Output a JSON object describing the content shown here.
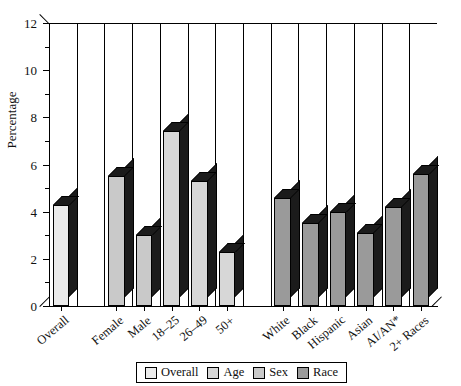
{
  "chart_data": {
    "type": "bar",
    "title": "",
    "xlabel": "",
    "ylabel": "Percentage",
    "ylim": [
      0,
      12
    ],
    "ytick_step": 2,
    "yminor_step": 1,
    "grid": true,
    "legend_position": "bottom",
    "style": "3d-bar",
    "categories": [
      "Overall",
      "Female",
      "Male",
      "18–25",
      "26–49",
      "50+",
      "White",
      "Black",
      "Hispanic",
      "Asian",
      "AI/AN*",
      "2+ Races"
    ],
    "values": [
      4.3,
      5.5,
      3.0,
      7.4,
      5.3,
      2.3,
      4.6,
      3.5,
      4.0,
      3.1,
      4.2,
      5.6
    ],
    "groups": [
      {
        "name": "Overall",
        "color": "#ebebeb",
        "categories": [
          "Overall"
        ],
        "values": [
          4.3
        ]
      },
      {
        "name": "Sex",
        "color": "#c9c9c9",
        "categories": [
          "Female",
          "Male"
        ],
        "values": [
          5.5,
          3.0
        ]
      },
      {
        "name": "Age",
        "color": "#d7d7d7",
        "categories": [
          "18–25",
          "26–49",
          "50+"
        ],
        "values": [
          7.4,
          5.3,
          2.3
        ]
      },
      {
        "name": "Race",
        "color": "#9a9a9a",
        "categories": [
          "White",
          "Black",
          "Hispanic",
          "Asian",
          "AI/AN*",
          "2+ Races"
        ],
        "values": [
          4.6,
          3.5,
          4.0,
          3.1,
          4.2,
          5.6
        ]
      }
    ],
    "ytick_labels": [
      "0",
      "2",
      "4",
      "6",
      "8",
      "10",
      "12"
    ],
    "side_face_color": "#1b1b1b",
    "axis_color": "#000000"
  },
  "legend": {
    "items": [
      {
        "label": "Overall",
        "color": "#ebebeb"
      },
      {
        "label": "Age",
        "color": "#d7d7d7"
      },
      {
        "label": "Sex",
        "color": "#c9c9c9"
      },
      {
        "label": "Race",
        "color": "#9a9a9a"
      }
    ]
  }
}
